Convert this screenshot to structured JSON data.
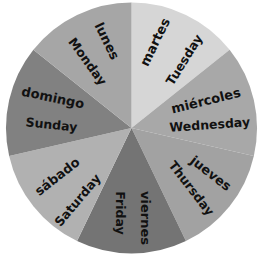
{
  "chart_data": {
    "type": "pie",
    "title": "",
    "start_angle_deg": 0,
    "direction": "clockwise",
    "categories": [
      "martes",
      "miércoles",
      "jueves",
      "viernes",
      "sábado",
      "domingo",
      "lunes"
    ],
    "values": [
      1,
      1,
      1,
      1,
      1,
      1,
      1
    ],
    "slices": [
      {
        "spanish": "martes",
        "english": "Tuesday",
        "value": 1,
        "color": "#d6d6d6"
      },
      {
        "spanish": "miércoles",
        "english": "Wednesday",
        "value": 1,
        "color": "#a8a8a8"
      },
      {
        "spanish": "jueves",
        "english": "Thursday",
        "value": 1,
        "color": "#a2a2a2"
      },
      {
        "spanish": "viernes",
        "english": "Friday",
        "value": 1,
        "color": "#747474"
      },
      {
        "spanish": "sábado",
        "english": "Saturday",
        "value": 1,
        "color": "#b1b1b1"
      },
      {
        "spanish": "domingo",
        "english": "Sunday",
        "value": 1,
        "color": "#818181"
      },
      {
        "spanish": "lunes",
        "english": "Monday",
        "value": 1,
        "color": "#a6a6a6"
      }
    ],
    "legend": "none"
  }
}
